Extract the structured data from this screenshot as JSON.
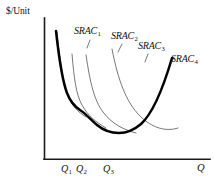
{
  "figure": {
    "type": "economics-cost-curve-diagram",
    "background_color": "#ffffff",
    "line_color": "#000000",
    "thin_curve_color": "#4a4a4a"
  },
  "axes": {
    "y_axis_label": "$/Unit",
    "x_axis_label": "Q",
    "x_origin_px": 44,
    "y_origin_px": 159
  },
  "x_ticks": [
    {
      "label": "Q",
      "sub": "1"
    },
    {
      "label": "Q",
      "sub": "2"
    },
    {
      "label": "Q",
      "sub": "3"
    }
  ],
  "curve_labels": [
    {
      "label": "SRAC",
      "sub": "1"
    },
    {
      "label": "SRAC",
      "sub": "2"
    },
    {
      "label": "SRAC",
      "sub": "3"
    },
    {
      "label": "SRAC",
      "sub": "4"
    }
  ],
  "chart_data": {
    "type": "line",
    "title": "",
    "subtitle": "",
    "xlabel": "Q",
    "ylabel": "$/Unit",
    "grid": false,
    "legend_position": "inline-curve-labels",
    "axis_ticks_numeric": false,
    "xtick_labels": [
      "Q1",
      "Q2",
      "Q3"
    ],
    "ytick_labels": [],
    "annotations": [
      "SRAC1",
      "SRAC2",
      "SRAC3",
      "SRAC4"
    ],
    "series": [
      {
        "name": "SRAC1",
        "style": "thin",
        "comment": "smallest plant; steep U, minimum near Q1",
        "path": "M 57,32 C 60,62 63,84 68,96 C 72,106 78,112 86,117",
        "minimum_point": [
          69,
          99
        ]
      },
      {
        "name": "SRAC2",
        "style": "thin",
        "comment": "second plant size; minimum near Q2",
        "path": "M 72,54 C 74,78 76,94 82,105 C 88,116 96,122 106,128",
        "minimum_point": [
          84,
          108
        ]
      },
      {
        "name": "SRAC3",
        "style": "thin",
        "comment": "third plant size; minimum near Q3",
        "path": "M 86,55 C 90,82 94,100 103,112 C 112,124 124,130 136,133",
        "minimum_point": [
          108,
          117
        ]
      },
      {
        "name": "SRAC4",
        "style": "thin",
        "comment": "largest plant; shallow U rising to the right",
        "path": "M 112,49 C 118,80 126,102 140,116 C 152,128 166,132 178,128",
        "minimum_point": [
          145,
          122
        ]
      },
      {
        "name": "LRAC-envelope",
        "style": "thick",
        "comment": "bold envelope curve: descends along SRAC1, scallops through tangency points, rises along SRAC4",
        "path": "M 56,31 C 59,58 62,80 67,93 C 70,101 74,106 80,110 C 85,113 90,119 97,125 C 103,130 110,133 119,133 C 127,133 134,130 141,124 C 152,114 162,92 172,58",
        "tangency_points": [
          [
            80,
            110
          ],
          [
            119,
            133
          ],
          [
            150,
            120
          ]
        ]
      }
    ],
    "x_tick_positions_px": [
      67,
      82,
      110
    ],
    "axis_range_px": {
      "x": [
        44,
        210
      ],
      "y": [
        18,
        159
      ]
    }
  }
}
